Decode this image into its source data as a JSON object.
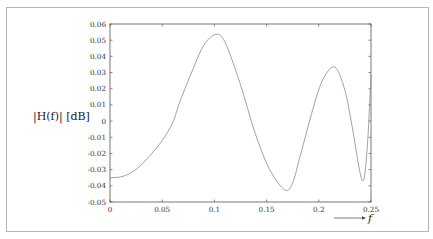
{
  "chart_data": {
    "type": "line",
    "title": "",
    "xlabel": "f",
    "ylabel": "|H(f)| [dB]",
    "xlim": [
      0,
      0.25
    ],
    "ylim": [
      -0.05,
      0.06
    ],
    "grid": false,
    "legend": null,
    "x_ticks": [
      "0",
      "0.05",
      "0.1",
      "0.15",
      "0.2",
      "0.25"
    ],
    "y_ticks": [
      "0.06",
      "0.05",
      "0.04",
      "0.03",
      "0.02",
      "0.01",
      "0",
      "-0.01",
      "-0.02",
      "-0.03",
      "-0.04",
      "-0.05"
    ],
    "series": [
      {
        "name": "|H(f)|",
        "color": "#8a8a8a",
        "x": [
          0,
          0.01,
          0.02,
          0.03,
          0.04,
          0.05,
          0.06,
          0.067,
          0.08,
          0.09,
          0.101,
          0.11,
          0.1245,
          0.139,
          0.153,
          0.1676,
          0.175,
          0.182,
          0.196,
          0.205,
          0.2155,
          0.225,
          0.232,
          0.2414,
          0.246,
          0.25
        ],
        "values": [
          -0.035,
          -0.0345,
          -0.032,
          -0.027,
          -0.02,
          -0.012,
          -0.001,
          0.012,
          0.033,
          0.047,
          0.0535,
          0.049,
          0.0235,
          -0.0074,
          -0.03,
          -0.0426,
          -0.038,
          -0.022,
          0.0112,
          0.027,
          0.0333,
          0.019,
          -0.0036,
          -0.0364,
          -0.02,
          0.0285
        ]
      }
    ]
  },
  "axis_labels": {
    "y": "|H(f)| [dB]",
    "y_italic_part": "H(f)",
    "x": "f"
  }
}
